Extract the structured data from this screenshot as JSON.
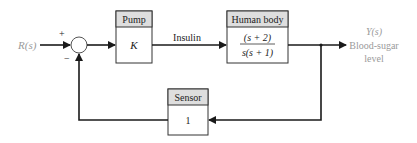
{
  "diagram": {
    "type": "feedback-control-block-diagram",
    "input": {
      "label": "R(s)"
    },
    "summing_junction": {
      "plus_sign": "+",
      "minus_sign": "−"
    },
    "blocks": [
      {
        "id": "pump",
        "title": "Pump",
        "transfer": "K"
      },
      {
        "id": "human_body",
        "title": "Human body",
        "numerator": "(s + 2)",
        "denominator": "s(s + 1)"
      },
      {
        "id": "sensor",
        "title": "Sensor",
        "transfer": "1"
      }
    ],
    "signals": {
      "insulin": "Insulin"
    },
    "output": {
      "label": "Y(s)",
      "desc_line1": "Blood-sugar",
      "desc_line2": "level"
    },
    "colors": {
      "line": "#1a1a1a",
      "header_fill": "#dedede",
      "output_text": "#9a9a9a",
      "input_text": "#9a9a9a"
    }
  }
}
